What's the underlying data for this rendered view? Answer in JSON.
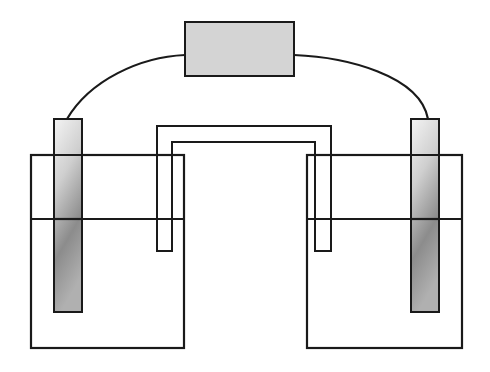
{
  "diagram": {
    "type": "electrochemical-cell",
    "labels": [],
    "colors": {
      "background": "#ffffff",
      "stroke": "#1a1a1a",
      "meter_fill": "#d4d4d4",
      "electrode_light": "#f2f2f2",
      "electrode_dark": "#8a8a8a"
    },
    "components": [
      {
        "name": "meter",
        "x": 185,
        "y": 22,
        "w": 109,
        "h": 54
      },
      {
        "name": "left-electrode",
        "x": 54,
        "y": 119,
        "w": 28,
        "h": 193
      },
      {
        "name": "right-electrode",
        "x": 411,
        "y": 119,
        "w": 28,
        "h": 193
      },
      {
        "name": "left-beaker",
        "x": 31,
        "y": 155,
        "w": 153,
        "h": 193,
        "liquid_level": 219
      },
      {
        "name": "right-beaker",
        "x": 307,
        "y": 155,
        "w": 155,
        "h": 193,
        "liquid_level": 219
      },
      {
        "name": "salt-bridge",
        "outer": {
          "x1": 157,
          "x2": 331,
          "top": 126
        },
        "inner": {
          "x1": 172,
          "x2": 315,
          "top": 142
        },
        "leg_bottom": 251
      }
    ]
  }
}
